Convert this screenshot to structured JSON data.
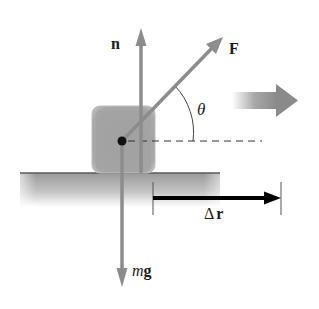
{
  "diagram": {
    "type": "physics-free-body-diagram",
    "labels": {
      "normal_force": "n",
      "applied_force": "F",
      "angle": "θ",
      "weight_m": "m",
      "weight_g": "g",
      "displacement_delta": "Δ",
      "displacement_r": "r"
    },
    "colors": {
      "force_arrow": "#8c8c8c",
      "block": "#a8a8a8",
      "ground_top": "#7a7a7a",
      "ground_fill": "#b8b8b8",
      "displacement_arrow": "#000000",
      "motion_arrow": "#8a8a8a",
      "text": "#1a1a1a"
    }
  }
}
